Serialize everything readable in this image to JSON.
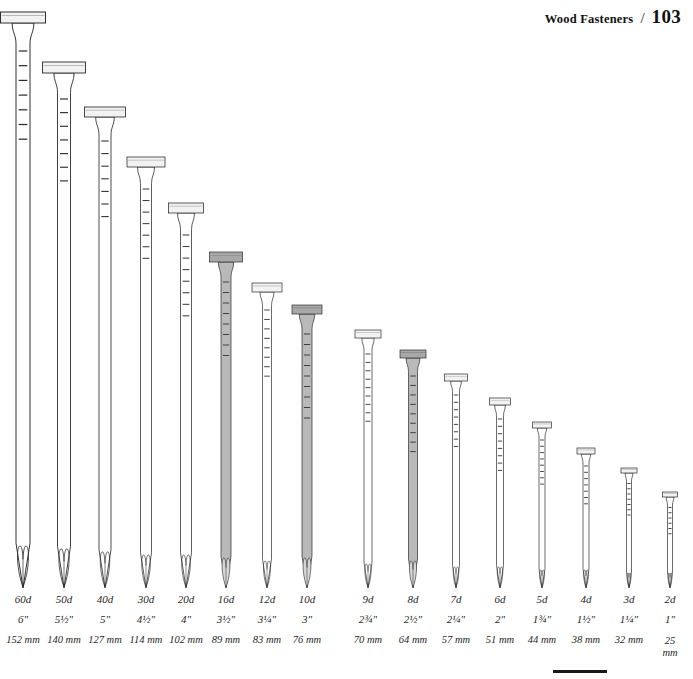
{
  "header": {
    "title": "Wood Fasteners",
    "separator": "/",
    "page_number": "103"
  },
  "figure": {
    "caption_absent": true,
    "baseline_y": 588,
    "nails": [
      {
        "penny": "60d",
        "inch": "6\"",
        "mm": "152 mm",
        "shaded": false,
        "cx": 23,
        "head_top": 12,
        "head_w": 45,
        "head_h": 11,
        "shaft_w": 14,
        "ticks": 7
      },
      {
        "penny": "50d",
        "inch": "5½\"",
        "mm": "140 mm",
        "shaded": false,
        "cx": 64,
        "head_top": 62,
        "head_w": 43,
        "head_h": 11,
        "shaft_w": 13,
        "ticks": 7
      },
      {
        "penny": "40d",
        "inch": "5\"",
        "mm": "127 mm",
        "shaded": false,
        "cx": 105,
        "head_top": 107,
        "head_w": 41,
        "head_h": 10,
        "shaft_w": 12,
        "ticks": 7
      },
      {
        "penny": "30d",
        "inch": "4½\"",
        "mm": "114 mm",
        "shaded": false,
        "cx": 146,
        "head_top": 157,
        "head_w": 38,
        "head_h": 10,
        "shaft_w": 11,
        "ticks": 7
      },
      {
        "penny": "20d",
        "inch": "4\"",
        "mm": "102 mm",
        "shaded": false,
        "cx": 186,
        "head_top": 203,
        "head_w": 35,
        "head_h": 10,
        "shaft_w": 11,
        "ticks": 8
      },
      {
        "penny": "16d",
        "inch": "3½\"",
        "mm": "89 mm",
        "shaded": true,
        "cx": 226,
        "head_top": 252,
        "head_w": 33,
        "head_h": 10,
        "shaft_w": 10,
        "ticks": 8
      },
      {
        "penny": "12d",
        "inch": "3¼\"",
        "mm": "83 mm",
        "shaded": false,
        "cx": 267,
        "head_top": 283,
        "head_w": 30,
        "head_h": 9,
        "shaft_w": 9,
        "ticks": 8
      },
      {
        "penny": "10d",
        "inch": "3\"",
        "mm": "76 mm",
        "shaded": true,
        "cx": 307,
        "head_top": 305,
        "head_w": 30,
        "head_h": 9,
        "shaft_w": 10,
        "ticks": 9
      },
      {
        "penny": "9d",
        "inch": "2¾\"",
        "mm": "70 mm",
        "shaded": false,
        "cx": 368,
        "head_top": 330,
        "head_w": 26,
        "head_h": 8,
        "shaft_w": 8,
        "ticks": 9
      },
      {
        "penny": "8d",
        "inch": "2½\"",
        "mm": "64 mm",
        "shaded": true,
        "cx": 413,
        "head_top": 350,
        "head_w": 26,
        "head_h": 8,
        "shaft_w": 9,
        "ticks": 9
      },
      {
        "penny": "7d",
        "inch": "2¼\"",
        "mm": "57 mm",
        "shaded": false,
        "cx": 456,
        "head_top": 374,
        "head_w": 23,
        "head_h": 7,
        "shaft_w": 7,
        "ticks": 8
      },
      {
        "penny": "6d",
        "inch": "2\"",
        "mm": "51 mm",
        "shaded": false,
        "cx": 500,
        "head_top": 398,
        "head_w": 21,
        "head_h": 7,
        "shaft_w": 7,
        "ticks": 8
      },
      {
        "penny": "5d",
        "inch": "1¾\"",
        "mm": "44 mm",
        "shaded": false,
        "cx": 542,
        "head_top": 422,
        "head_w": 19,
        "head_h": 6,
        "shaft_w": 6,
        "ticks": 8
      },
      {
        "penny": "4d",
        "inch": "1½\"",
        "mm": "38 mm",
        "shaded": false,
        "cx": 586,
        "head_top": 448,
        "head_w": 18,
        "head_h": 6,
        "shaft_w": 6,
        "ticks": 7
      },
      {
        "penny": "3d",
        "inch": "1¼\"",
        "mm": "32 mm",
        "shaded": false,
        "cx": 629,
        "head_top": 468,
        "head_w": 16,
        "head_h": 5,
        "shaft_w": 5,
        "ticks": 7
      },
      {
        "penny": "2d",
        "inch": "1\"",
        "mm": "25 mm",
        "mm_line1": "25",
        "mm_line2": "mm",
        "mm_stacked": true,
        "shaded": false,
        "cx": 670,
        "head_top": 492,
        "head_w": 15,
        "head_h": 5,
        "shaft_w": 5,
        "ticks": 6
      }
    ]
  },
  "scale_bar": {
    "present": true
  },
  "colors": {
    "ink": "#1a1a1a",
    "outline": "#2b2b2b",
    "head_fill": "#f2f2f2",
    "shaft_fill": "#ffffff",
    "shaded_fill": "#b9b9b9",
    "shaded_head_fill": "#a8a8a8",
    "tip_shade": "#d6d6d6",
    "page_bg": "#ffffff"
  }
}
